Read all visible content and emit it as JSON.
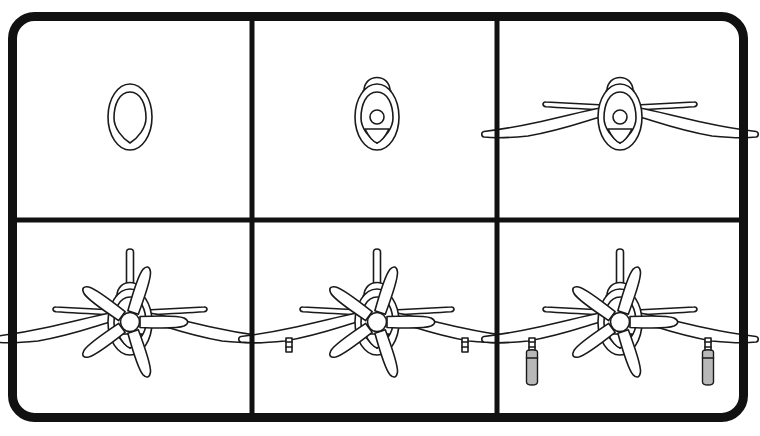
{
  "document": {
    "title": "How to Draw a Propeller Airplane (Front View)",
    "type": "step-by-step drawing tutorial",
    "panel_count": 6,
    "grid": {
      "columns": 3,
      "rows": 2
    }
  },
  "style": {
    "background_color": "#ffffff",
    "ink_color": "#1a1a1a",
    "border_color": "#111111",
    "wheel_fill_color": "#b8b8b8",
    "fill_color": "#ffffff",
    "border_width": 9,
    "border_radius": 22,
    "grid_line_width": 5,
    "stroke_width": 1.6
  },
  "frame": {
    "x": 8,
    "y": 12,
    "width": 740,
    "height": 410,
    "divider_x_1": 252,
    "divider_x_2": 497,
    "divider_y": 220
  },
  "panels": [
    {
      "index": 1,
      "name": "step-1",
      "description": "Outer cowl oval with inner cowl lip oval",
      "center_x": 130,
      "center_y": 117,
      "parts": [
        "cowl-outer-oval",
        "cowl-inner-oval"
      ]
    },
    {
      "index": 2,
      "name": "step-2",
      "description": "Adds canopy dome, spinner hub circle and V air intake",
      "center_x": 377,
      "center_y": 117,
      "parts": [
        "cowl-outer-oval",
        "cowl-inner-oval",
        "canopy-dome",
        "spinner-hub",
        "air-intake"
      ]
    },
    {
      "index": 3,
      "name": "step-3",
      "description": "Adds gull main wings and horizontal tailplane",
      "center_x": 620,
      "center_y": 117,
      "parts": [
        "cowl-outer-oval",
        "cowl-inner-oval",
        "canopy-dome",
        "spinner-hub",
        "air-intake",
        "main-wings",
        "horizontal-tailplane"
      ]
    },
    {
      "index": 4,
      "name": "step-4",
      "description": "Adds five-blade propeller, spinner and vertical tail fin",
      "center_x": 130,
      "center_y": 322,
      "parts": [
        "fuselage",
        "main-wings",
        "horizontal-tailplane",
        "vertical-tail-fin",
        "propeller-blades",
        "propeller-hub"
      ]
    },
    {
      "index": 5,
      "name": "step-5",
      "description": "Adds landing gear strut stubs under each wing",
      "center_x": 377,
      "center_y": 322,
      "parts": [
        "fuselage",
        "main-wings",
        "horizontal-tailplane",
        "vertical-tail-fin",
        "propeller-blades",
        "propeller-hub",
        "gear-struts"
      ]
    },
    {
      "index": 6,
      "name": "step-6",
      "description": "Adds landing gear wheel pods, shaded grey",
      "center_x": 620,
      "center_y": 322,
      "parts": [
        "fuselage",
        "main-wings",
        "horizontal-tailplane",
        "vertical-tail-fin",
        "propeller-blades",
        "propeller-hub",
        "gear-struts",
        "gear-wheels"
      ]
    }
  ],
  "aircraft": {
    "subject": "single-engine propeller fighter aircraft, front elevation",
    "propeller_blade_count": 5,
    "propeller_blade_angles_deg": [
      18,
      90,
      162,
      234,
      306
    ],
    "wing_type": "inverted gull wing",
    "landing_gear_count": 2
  }
}
